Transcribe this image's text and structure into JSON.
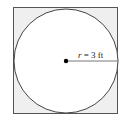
{
  "diagram": {
    "shape": "circle inscribed in square",
    "radius_label_var": "r",
    "radius_label_eq": " = 3 ft",
    "radius_label": "r = 3 ft",
    "colors": {
      "square_fill": "#efefef",
      "stroke": "#555555",
      "circle_fill": "#ffffff",
      "center_dot": "#000000"
    }
  }
}
